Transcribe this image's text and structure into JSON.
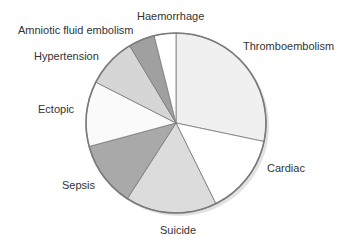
{
  "chart_data": {
    "type": "pie",
    "title": "",
    "start_angle_deg": 0,
    "direction": "clockwise",
    "categories": [
      "Thromboembolism",
      "Cardiac",
      "Suicide",
      "Sepsis",
      "Ectopic",
      "Hypertension",
      "Amniotic fluid embolism",
      "Haemorrhage"
    ],
    "values": [
      28.3,
      14.4,
      16.4,
      11.7,
      11.7,
      8.9,
      4.7,
      3.9
    ],
    "value_unit": "percent (estimated from slice angles)",
    "colors": [
      "#f0f0f0",
      "#ffffff",
      "#dcdcdc",
      "#a9a9a9",
      "#fafafa",
      "#d6d6d6",
      "#a0a0a0",
      "#ffffff"
    ],
    "outline_color": "#7a7a7a",
    "legend": "none (direct labels)"
  },
  "labels": [
    {
      "text": "Thromboembolism",
      "x": 243,
      "y": 40
    },
    {
      "text": "Cardiac",
      "x": 267,
      "y": 162
    },
    {
      "text": "Suicide",
      "x": 160,
      "y": 224
    },
    {
      "text": "Sepsis",
      "x": 62,
      "y": 179
    },
    {
      "text": "Ectopic",
      "x": 38,
      "y": 103
    },
    {
      "text": "Hypertension",
      "x": 34,
      "y": 50
    },
    {
      "text": "Amniotic fluid embolism",
      "x": 18,
      "y": 24
    },
    {
      "text": "Haemorrhage",
      "x": 137,
      "y": 10
    }
  ]
}
